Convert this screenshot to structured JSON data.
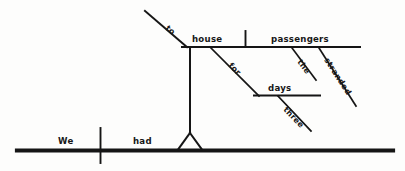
{
  "diagram": {
    "type": "reed-kellogg-sentence-diagram",
    "sentence": "We had to house the stranded passengers for three days.",
    "ink_color": "#151515",
    "background_color": "#fdfdfc",
    "baseline": {
      "subject": "We",
      "verb": "had"
    },
    "infinitive_phrase": {
      "particle": "to",
      "verb": "house",
      "object": "passengers",
      "object_modifiers": [
        "the",
        "stranded"
      ]
    },
    "prepositional_phrase": {
      "preposition": "for",
      "object": "days",
      "object_modifiers": [
        "three"
      ]
    },
    "words": {
      "we": "We",
      "had": "had",
      "to": "to",
      "house": "house",
      "passengers": "passengers",
      "the": "the",
      "stranded": "stranded",
      "for": "for",
      "days": "days",
      "three": "three"
    }
  }
}
